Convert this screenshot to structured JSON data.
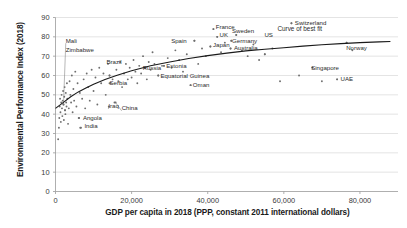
{
  "chart_data": {
    "type": "scatter",
    "title": "",
    "xlabel": "GDP per capita in 2018 (PPP, constant 2011 international dollars)",
    "ylabel": "Environmental Performance Index (2018)",
    "xlim": [
      0,
      90000
    ],
    "ylim": [
      0,
      90
    ],
    "xticks": [
      0,
      20000,
      40000,
      60000,
      80000
    ],
    "xtick_labels": [
      "0",
      "20,000",
      "40,000",
      "60,000",
      "80,000"
    ],
    "yticks": [
      0,
      10,
      20,
      30,
      40,
      50,
      60,
      70,
      80,
      90
    ],
    "ytick_labels": [
      "0",
      "10",
      "20",
      "30",
      "40",
      "50",
      "60",
      "70",
      "80",
      "90"
    ],
    "grid": "horizontal",
    "legend": "none",
    "marker_color": "#6e6e6e",
    "trendline_color": "#1a1a1a",
    "gridline_color": "#d9d9d9",
    "annotations": [
      {
        "text": "Curve of best fit",
        "x": 67500,
        "y": 84
      }
    ],
    "labeled_points": [
      {
        "name": "Mali",
        "x": 2100,
        "y": 45,
        "label_x": 2300,
        "label_y": 78,
        "leader": true
      },
      {
        "name": "Zimbabwe",
        "x": 2500,
        "y": 42,
        "label_x": 2300,
        "label_y": 73,
        "leader": false
      },
      {
        "name": "Brazil",
        "x": 14200,
        "y": 60,
        "label_x": 13000,
        "label_y": 67,
        "leader": false
      },
      {
        "name": "Spain",
        "x": 36500,
        "y": 78,
        "label_x": 30000,
        "label_y": 78,
        "leader": false
      },
      {
        "name": "France",
        "x": 41500,
        "y": 84,
        "label_x": 41700,
        "label_y": 85,
        "leader": false
      },
      {
        "name": "UK",
        "x": 42500,
        "y": 80,
        "label_x": 42700,
        "label_y": 81,
        "leader": false
      },
      {
        "name": "Japan",
        "x": 40700,
        "y": 75,
        "label_x": 41000,
        "label_y": 76,
        "leader": false
      },
      {
        "name": "Sweden",
        "x": 47500,
        "y": 81,
        "label_x": 46000,
        "label_y": 83,
        "leader": false
      },
      {
        "name": "Germany",
        "x": 46200,
        "y": 78,
        "label_x": 46000,
        "label_y": 78,
        "leader": false
      },
      {
        "name": "US",
        "x": 55000,
        "y": 71,
        "label_x": 54500,
        "label_y": 81,
        "leader": false
      },
      {
        "name": "Australia",
        "x": 46000,
        "y": 74,
        "label_x": 46500,
        "label_y": 74,
        "leader": false
      },
      {
        "name": "Switzerland",
        "x": 62000,
        "y": 87,
        "label_x": 62500,
        "label_y": 87,
        "leader": false
      },
      {
        "name": "Norway",
        "x": 76500,
        "y": 77,
        "label_x": 76000,
        "label_y": 74,
        "leader": false
      },
      {
        "name": "Singapore",
        "x": 67500,
        "y": 64,
        "label_x": 66800,
        "label_y": 64,
        "leader": false
      },
      {
        "name": "UAE",
        "x": 74000,
        "y": 58,
        "label_x": 74500,
        "label_y": 58,
        "leader": false
      },
      {
        "name": "Russia",
        "x": 23500,
        "y": 64,
        "label_x": 22500,
        "label_y": 64,
        "leader": false
      },
      {
        "name": "Estonia",
        "x": 28500,
        "y": 65,
        "label_x": 28700,
        "label_y": 65,
        "leader": false
      },
      {
        "name": "Equatorial Guinea",
        "x": 27000,
        "y": 60,
        "label_x": 27200,
        "label_y": 60,
        "leader": false
      },
      {
        "name": "Oman",
        "x": 35500,
        "y": 55,
        "label_x": 35700,
        "label_y": 55,
        "leader": false
      },
      {
        "name": "Serbia",
        "x": 14200,
        "y": 56,
        "label_x": 13800,
        "label_y": 56,
        "leader": false
      },
      {
        "name": "Iraq",
        "x": 14000,
        "y": 44,
        "label_x": 13500,
        "label_y": 44,
        "leader": true
      },
      {
        "name": "China",
        "x": 15800,
        "y": 46,
        "label_x": 17000,
        "label_y": 43,
        "leader": true
      },
      {
        "name": "Angola",
        "x": 6200,
        "y": 38,
        "label_x": 6800,
        "label_y": 38,
        "leader": false
      },
      {
        "name": "India",
        "x": 6500,
        "y": 33,
        "label_x": 7200,
        "label_y": 34,
        "leader": false
      }
    ],
    "points": [
      [
        700,
        27
      ],
      [
        900,
        33
      ],
      [
        1000,
        38
      ],
      [
        1100,
        44
      ],
      [
        1200,
        48
      ],
      [
        1300,
        41
      ],
      [
        1400,
        36
      ],
      [
        1500,
        46
      ],
      [
        1600,
        50
      ],
      [
        1700,
        43
      ],
      [
        1800,
        39
      ],
      [
        1900,
        47
      ],
      [
        2000,
        52
      ],
      [
        2100,
        45
      ],
      [
        2200,
        37
      ],
      [
        2300,
        49
      ],
      [
        2400,
        54
      ],
      [
        2500,
        42
      ],
      [
        2600,
        40
      ],
      [
        2700,
        51
      ],
      [
        2800,
        46
      ],
      [
        2900,
        44
      ],
      [
        3000,
        56
      ],
      [
        3100,
        48
      ],
      [
        3300,
        35
      ],
      [
        3500,
        43
      ],
      [
        3700,
        57
      ],
      [
        3900,
        50
      ],
      [
        4100,
        46
      ],
      [
        4300,
        60
      ],
      [
        4500,
        41
      ],
      [
        4700,
        53
      ],
      [
        4900,
        47
      ],
      [
        5200,
        62
      ],
      [
        5500,
        44
      ],
      [
        5800,
        56
      ],
      [
        6100,
        38
      ],
      [
        6400,
        51
      ],
      [
        6700,
        33
      ],
      [
        7000,
        48
      ],
      [
        7400,
        58
      ],
      [
        7800,
        43
      ],
      [
        8200,
        61
      ],
      [
        8600,
        54
      ],
      [
        9000,
        47
      ],
      [
        9500,
        63
      ],
      [
        10000,
        52
      ],
      [
        10500,
        59
      ],
      [
        11000,
        45
      ],
      [
        11500,
        64
      ],
      [
        12000,
        56
      ],
      [
        12600,
        61
      ],
      [
        13200,
        50
      ],
      [
        13800,
        66
      ],
      [
        14200,
        60
      ],
      [
        14500,
        56
      ],
      [
        15000,
        58
      ],
      [
        15500,
        46
      ],
      [
        16000,
        63
      ],
      [
        16500,
        57
      ],
      [
        17000,
        67
      ],
      [
        17500,
        54
      ],
      [
        18000,
        61
      ],
      [
        18500,
        66
      ],
      [
        19000,
        58
      ],
      [
        19500,
        64
      ],
      [
        20000,
        59
      ],
      [
        20500,
        68
      ],
      [
        21000,
        62
      ],
      [
        21500,
        56
      ],
      [
        22000,
        65
      ],
      [
        22500,
        61
      ],
      [
        23000,
        70
      ],
      [
        23500,
        64
      ],
      [
        24000,
        58
      ],
      [
        24500,
        67
      ],
      [
        25000,
        63
      ],
      [
        25500,
        72
      ],
      [
        26000,
        66
      ],
      [
        27000,
        60
      ],
      [
        28000,
        65
      ],
      [
        28500,
        65
      ],
      [
        29500,
        69
      ],
      [
        30500,
        64
      ],
      [
        31500,
        73
      ],
      [
        32500,
        68
      ],
      [
        33500,
        62
      ],
      [
        34500,
        71
      ],
      [
        35500,
        55
      ],
      [
        36500,
        78
      ],
      [
        37500,
        66
      ],
      [
        38500,
        74
      ],
      [
        39500,
        70
      ],
      [
        40700,
        75
      ],
      [
        41500,
        84
      ],
      [
        42500,
        80
      ],
      [
        43500,
        72
      ],
      [
        44500,
        77
      ],
      [
        46000,
        74
      ],
      [
        46200,
        78
      ],
      [
        47500,
        81
      ],
      [
        49000,
        73
      ],
      [
        50500,
        70
      ],
      [
        52000,
        76
      ],
      [
        53500,
        68
      ],
      [
        55000,
        71
      ],
      [
        57000,
        74
      ],
      [
        59000,
        57
      ],
      [
        62000,
        87
      ],
      [
        64000,
        60
      ],
      [
        67500,
        64
      ],
      [
        70000,
        57
      ],
      [
        74000,
        58
      ],
      [
        76500,
        77
      ],
      [
        78000,
        73
      ]
    ],
    "trendline": [
      [
        0,
        43
      ],
      [
        2000,
        46
      ],
      [
        4000,
        49
      ],
      [
        6000,
        51.5
      ],
      [
        8000,
        53.5
      ],
      [
        10000,
        55.5
      ],
      [
        13000,
        58
      ],
      [
        16000,
        60
      ],
      [
        20000,
        62.5
      ],
      [
        25000,
        65
      ],
      [
        30000,
        67
      ],
      [
        35000,
        68.8
      ],
      [
        40000,
        70.3
      ],
      [
        45000,
        71.6
      ],
      [
        50000,
        72.7
      ],
      [
        55000,
        73.6
      ],
      [
        60000,
        74.4
      ],
      [
        65000,
        75.2
      ],
      [
        70000,
        75.9
      ],
      [
        75000,
        76.5
      ],
      [
        80000,
        77
      ],
      [
        85000,
        77.4
      ],
      [
        88000,
        77.6
      ]
    ]
  }
}
